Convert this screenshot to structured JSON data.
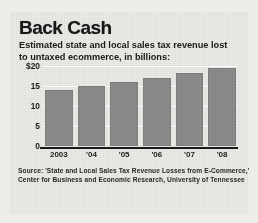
{
  "title": "Back Cash",
  "subtitle_line1": "Estimated state and local sales tax revenue lost",
  "subtitle_line2": "to untaxed ecommerce, in billions:",
  "source_line1": "Source: 'State and Local Sales Tax Revenue Losses from E-Commerce,'",
  "source_line2": "Center for Business and Economic Research, University of Tennessee",
  "colors": {
    "bar": "#8b8b8b",
    "paper": "#e9e8e4",
    "axis": "#1c1c1c",
    "gridline": "#ffffff",
    "text": "#1a1a1a"
  },
  "chart_data": {
    "type": "bar",
    "title": "Back Cash",
    "subtitle": "Estimated state and local sales tax revenue lost to untaxed ecommerce, in billions:",
    "categories": [
      "2003",
      "'04",
      "'05",
      "'06",
      "'07",
      "'08"
    ],
    "values": [
      14,
      15,
      16,
      17,
      18.3,
      19.6
    ],
    "xlabel": "",
    "ylabel": "",
    "ylim": [
      0,
      20
    ],
    "yticks": [
      0,
      5,
      10,
      15,
      20
    ],
    "ytick_labels": [
      "0",
      "5",
      "10",
      "15",
      "$20"
    ],
    "units": "billions of US dollars",
    "grid": true,
    "legend": false
  }
}
